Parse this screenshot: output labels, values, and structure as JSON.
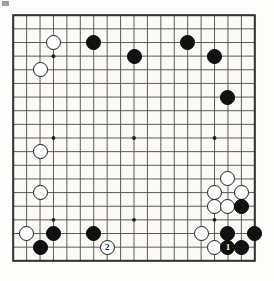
{
  "figure": {
    "type": "go-board-diagram",
    "board_size": 19,
    "caption": "",
    "colors": {
      "board_background": "#fbfaf6",
      "line": "#4a4a4a",
      "border": "#333333",
      "black_stone": "#111111",
      "white_stone": "#ffffff",
      "page_background": "#fdfdfb"
    }
  },
  "board": {
    "size": 19,
    "star_points": [
      {
        "col": 3,
        "row": 3
      },
      {
        "col": 9,
        "row": 3
      },
      {
        "col": 15,
        "row": 3
      },
      {
        "col": 3,
        "row": 9
      },
      {
        "col": 9,
        "row": 9
      },
      {
        "col": 15,
        "row": 9
      },
      {
        "col": 3,
        "row": 15
      },
      {
        "col": 9,
        "row": 15
      },
      {
        "col": 15,
        "row": 15
      }
    ],
    "stones": [
      {
        "col": 3,
        "row": 2,
        "color": "white",
        "label": ""
      },
      {
        "col": 6,
        "row": 2,
        "color": "black",
        "label": ""
      },
      {
        "col": 13,
        "row": 2,
        "color": "black",
        "label": ""
      },
      {
        "col": 9,
        "row": 3,
        "color": "black",
        "label": ""
      },
      {
        "col": 15,
        "row": 3,
        "color": "black",
        "label": ""
      },
      {
        "col": 2,
        "row": 4,
        "color": "white",
        "label": ""
      },
      {
        "col": 16,
        "row": 6,
        "color": "black",
        "label": ""
      },
      {
        "col": 2,
        "row": 10,
        "color": "white",
        "label": ""
      },
      {
        "col": 16,
        "row": 12,
        "color": "white",
        "label": ""
      },
      {
        "col": 2,
        "row": 13,
        "color": "white",
        "label": ""
      },
      {
        "col": 15,
        "row": 13,
        "color": "white",
        "label": ""
      },
      {
        "col": 17,
        "row": 13,
        "color": "white",
        "label": ""
      },
      {
        "col": 15,
        "row": 14,
        "color": "white",
        "label": ""
      },
      {
        "col": 16,
        "row": 14,
        "color": "white",
        "label": ""
      },
      {
        "col": 17,
        "row": 14,
        "color": "black",
        "label": ""
      },
      {
        "col": 1,
        "row": 16,
        "color": "white",
        "label": ""
      },
      {
        "col": 3,
        "row": 16,
        "color": "black",
        "label": ""
      },
      {
        "col": 6,
        "row": 16,
        "color": "black",
        "label": ""
      },
      {
        "col": 14,
        "row": 16,
        "color": "white",
        "label": ""
      },
      {
        "col": 16,
        "row": 16,
        "color": "black",
        "label": ""
      },
      {
        "col": 18,
        "row": 16,
        "color": "black",
        "label": ""
      },
      {
        "col": 2,
        "row": 17,
        "color": "black",
        "label": ""
      },
      {
        "col": 7,
        "row": 17,
        "color": "white",
        "label": "2"
      },
      {
        "col": 15,
        "row": 17,
        "color": "white",
        "label": ""
      },
      {
        "col": 16,
        "row": 17,
        "color": "black",
        "label": "1"
      },
      {
        "col": 17,
        "row": 17,
        "color": "black",
        "label": ""
      }
    ]
  },
  "move_labels": {
    "black_move": "1",
    "white_move": "2"
  }
}
